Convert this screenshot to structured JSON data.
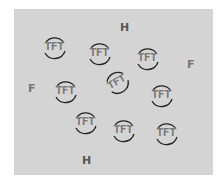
{
  "diagram": {
    "background_color": "#d4d4d4",
    "molecule_label": "TFT",
    "molecules": [
      {
        "x": 40,
        "y": 34,
        "rot": 0
      },
      {
        "x": 85,
        "y": 40,
        "rot": 0
      },
      {
        "x": 133,
        "y": 45,
        "rot": 0
      },
      {
        "x": 103,
        "y": 69,
        "rot": -30
      },
      {
        "x": 51,
        "y": 78,
        "rot": 0
      },
      {
        "x": 147,
        "y": 82,
        "rot": 0
      },
      {
        "x": 71,
        "y": 109,
        "rot": 0
      },
      {
        "x": 109,
        "y": 117,
        "rot": 0
      },
      {
        "x": 152,
        "y": 120,
        "rot": 0
      }
    ],
    "atoms": [
      {
        "label": "H",
        "x": 120,
        "y": 22,
        "type": "h"
      },
      {
        "label": "F",
        "x": 187,
        "y": 59,
        "type": "f"
      },
      {
        "label": "F",
        "x": 28,
        "y": 83,
        "type": "f"
      },
      {
        "label": "H",
        "x": 82,
        "y": 155,
        "type": "h"
      }
    ]
  }
}
